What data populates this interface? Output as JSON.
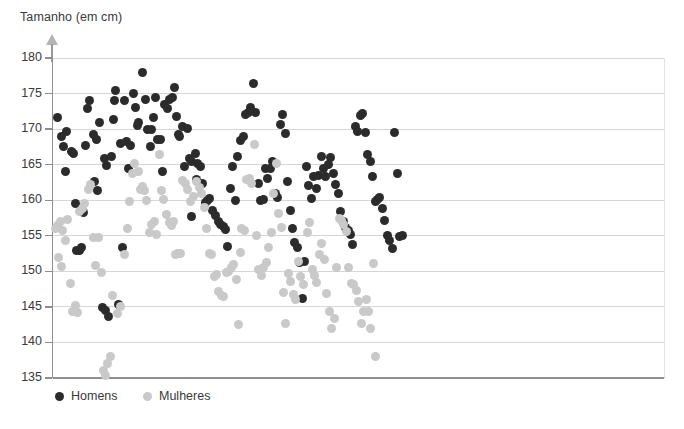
{
  "chart_data": {
    "type": "scatter",
    "title": "",
    "axis_label_y": "Tamanho (em cm)",
    "xlabel": "",
    "ylabel": "Tamanho (em cm)",
    "ylim": [
      135,
      180
    ],
    "yticks": [
      135,
      140,
      145,
      150,
      155,
      160,
      165,
      170,
      175,
      180
    ],
    "grid": true,
    "grid_axis": "y",
    "xaxis_visible": false,
    "xlim": [
      0,
      150
    ],
    "legend_position": "bottom-left",
    "colors": {
      "homens": "#2b2b2b",
      "mulheres": "#c9c9c9",
      "grid": "#d6d6d6",
      "axis": "#8e8e8e"
    },
    "series": [
      {
        "name": "Homens",
        "color": "#2b2b2b",
        "marker": "circle",
        "count": 150,
        "points": [
          [
            1.0,
            171.6
          ],
          [
            2.2,
            169.0
          ],
          [
            2.6,
            167.6
          ],
          [
            3.4,
            169.6
          ],
          [
            4.6,
            166.8
          ],
          [
            3.0,
            164.0
          ],
          [
            5.0,
            166.6
          ],
          [
            5.6,
            159.5
          ],
          [
            7.4,
            158.3
          ],
          [
            8.4,
            172.9
          ],
          [
            9.0,
            174.0
          ],
          [
            8.0,
            167.7
          ],
          [
            10.0,
            169.3
          ],
          [
            10.6,
            168.6
          ],
          [
            11.4,
            170.9
          ],
          [
            11.0,
            161.3
          ],
          [
            10.2,
            162.7
          ],
          [
            12.6,
            165.8
          ],
          [
            13.2,
            164.9
          ],
          [
            14.2,
            166.2
          ],
          [
            14.8,
            171.4
          ],
          [
            15.2,
            175.4
          ],
          [
            15.0,
            174.0
          ],
          [
            16.6,
            168.0
          ],
          [
            17.4,
            174.0
          ],
          [
            18.4,
            164.4
          ],
          [
            18.0,
            168.2
          ],
          [
            19.0,
            167.7
          ],
          [
            19.6,
            175.0
          ],
          [
            20.2,
            173.1
          ],
          [
            20.6,
            170.5
          ],
          [
            21.0,
            171.0
          ],
          [
            21.8,
            177.9
          ],
          [
            22.6,
            174.2
          ],
          [
            23.2,
            169.9
          ],
          [
            23.8,
            167.6
          ],
          [
            24.6,
            171.7
          ],
          [
            25.0,
            174.5
          ],
          [
            25.6,
            168.5
          ],
          [
            26.2,
            168.6
          ],
          [
            26.8,
            164.0
          ],
          [
            27.4,
            173.5
          ],
          [
            28.0,
            172.9
          ],
          [
            28.6,
            174.2
          ],
          [
            29.2,
            174.5
          ],
          [
            29.8,
            175.9
          ],
          [
            30.2,
            171.8
          ],
          [
            30.8,
            169.2
          ],
          [
            31.0,
            168.9
          ],
          [
            31.6,
            170.3
          ],
          [
            32.2,
            164.8
          ],
          [
            32.8,
            170.1
          ],
          [
            33.4,
            165.9
          ],
          [
            34.0,
            165.4
          ],
          [
            34.8,
            166.6
          ],
          [
            35.4,
            165.1
          ],
          [
            36.0,
            164.8
          ],
          [
            36.6,
            162.3
          ],
          [
            37.2,
            159.7
          ],
          [
            37.8,
            159.9
          ],
          [
            38.4,
            160.2
          ],
          [
            39.0,
            158.6
          ],
          [
            39.8,
            157.9
          ],
          [
            40.4,
            157.0
          ],
          [
            41.0,
            156.6
          ],
          [
            41.6,
            156.3
          ],
          [
            42.2,
            155.9
          ],
          [
            42.8,
            153.5
          ],
          [
            43.4,
            161.6
          ],
          [
            44.0,
            164.8
          ],
          [
            44.6,
            160.0
          ],
          [
            45.2,
            166.2
          ],
          [
            46.0,
            168.4
          ],
          [
            46.6,
            169.0
          ],
          [
            47.2,
            172.1
          ],
          [
            47.8,
            172.4
          ],
          [
            48.4,
            173.1
          ],
          [
            49.0,
            176.4
          ],
          [
            49.6,
            172.3
          ],
          [
            50.2,
            162.4
          ],
          [
            50.8,
            159.9
          ],
          [
            51.4,
            160.1
          ],
          [
            52.0,
            164.4
          ],
          [
            52.6,
            163.0
          ],
          [
            53.2,
            164.5
          ],
          [
            53.8,
            165.4
          ],
          [
            54.4,
            161.0
          ],
          [
            55.0,
            160.4
          ],
          [
            55.6,
            170.7
          ],
          [
            56.2,
            172.0
          ],
          [
            56.8,
            169.4
          ],
          [
            57.4,
            162.7
          ],
          [
            58.0,
            158.5
          ],
          [
            58.6,
            156.0
          ],
          [
            59.2,
            154.1
          ],
          [
            59.8,
            153.3
          ],
          [
            60.4,
            151.3
          ],
          [
            61.0,
            146.2
          ],
          [
            62.0,
            164.8
          ],
          [
            62.6,
            162.1
          ],
          [
            63.2,
            160.2
          ],
          [
            63.8,
            163.4
          ],
          [
            64.4,
            161.7
          ],
          [
            65.0,
            163.5
          ],
          [
            65.6,
            166.1
          ],
          [
            66.2,
            164.5
          ],
          [
            66.8,
            163.4
          ],
          [
            67.4,
            165.0
          ],
          [
            68.0,
            166.0
          ],
          [
            68.6,
            163.8
          ],
          [
            69.2,
            162.2
          ],
          [
            69.8,
            160.9
          ],
          [
            70.4,
            158.4
          ],
          [
            71.0,
            157.0
          ],
          [
            71.6,
            156.2
          ],
          [
            72.2,
            155.8
          ],
          [
            72.8,
            155.2
          ],
          [
            73.4,
            153.8
          ],
          [
            74.0,
            170.3
          ],
          [
            74.6,
            169.6
          ],
          [
            75.2,
            171.9
          ],
          [
            75.8,
            172.2
          ],
          [
            76.4,
            169.5
          ],
          [
            77.0,
            166.5
          ],
          [
            77.6,
            165.4
          ],
          [
            78.2,
            163.3
          ],
          [
            78.8,
            159.8
          ],
          [
            79.4,
            160.1
          ],
          [
            80.0,
            160.4
          ],
          [
            80.6,
            158.8
          ],
          [
            81.2,
            157.1
          ],
          [
            81.8,
            155.0
          ],
          [
            82.4,
            154.3
          ],
          [
            83.0,
            153.2
          ],
          [
            83.6,
            169.5
          ],
          [
            84.2,
            163.8
          ],
          [
            84.8,
            154.9
          ],
          [
            85.4,
            155.0
          ],
          [
            5.8,
            152.9
          ],
          [
            6.4,
            153.0
          ],
          [
            7.0,
            153.4
          ],
          [
            12.0,
            144.9
          ],
          [
            12.8,
            144.5
          ],
          [
            13.6,
            143.6
          ],
          [
            16.0,
            145.3
          ],
          [
            17.0,
            153.3
          ],
          [
            61.6,
            151.4
          ],
          [
            33.8,
            157.7
          ],
          [
            35.0,
            162.9
          ],
          [
            24.0,
            170.0
          ]
        ]
      },
      {
        "name": "Mulheres",
        "color": "#c9c9c9",
        "marker": "circle",
        "count": 130,
        "points": [
          [
            0.6,
            156.0
          ],
          [
            1.2,
            156.4
          ],
          [
            1.8,
            157.0
          ],
          [
            2.4,
            155.8
          ],
          [
            3.0,
            154.4
          ],
          [
            3.6,
            157.3
          ],
          [
            2.0,
            150.7
          ],
          [
            1.4,
            152.0
          ],
          [
            4.2,
            148.3
          ],
          [
            4.8,
            144.3
          ],
          [
            5.4,
            145.2
          ],
          [
            6.0,
            144.2
          ],
          [
            6.6,
            158.4
          ],
          [
            7.2,
            158.8
          ],
          [
            7.8,
            159.5
          ],
          [
            8.6,
            161.5
          ],
          [
            9.2,
            162.2
          ],
          [
            9.8,
            154.7
          ],
          [
            10.4,
            150.8
          ],
          [
            11.2,
            154.8
          ],
          [
            11.8,
            149.8
          ],
          [
            12.4,
            136.0
          ],
          [
            12.9,
            135.3
          ],
          [
            13.4,
            137.0
          ],
          [
            14.0,
            138.0
          ],
          [
            14.6,
            146.6
          ],
          [
            15.8,
            144.1
          ],
          [
            16.4,
            145.0
          ],
          [
            17.6,
            152.4
          ],
          [
            18.2,
            156.0
          ],
          [
            18.8,
            159.8
          ],
          [
            19.4,
            163.8
          ],
          [
            20.0,
            165.1
          ],
          [
            20.8,
            164.0
          ],
          [
            21.4,
            161.5
          ],
          [
            22.0,
            162.0
          ],
          [
            22.4,
            161.3
          ],
          [
            23.0,
            160.0
          ],
          [
            23.6,
            155.4
          ],
          [
            24.2,
            156.6
          ],
          [
            24.8,
            157.0
          ],
          [
            25.4,
            155.2
          ],
          [
            26.0,
            166.4
          ],
          [
            26.6,
            161.4
          ],
          [
            27.0,
            160.1
          ],
          [
            27.8,
            158.0
          ],
          [
            28.4,
            156.8
          ],
          [
            29.0,
            156.4
          ],
          [
            29.6,
            157.0
          ],
          [
            30.4,
            152.5
          ],
          [
            31.2,
            152.5
          ],
          [
            31.8,
            162.8
          ],
          [
            32.4,
            162.4
          ],
          [
            33.0,
            161.5
          ],
          [
            33.6,
            159.8
          ],
          [
            34.4,
            160.5
          ],
          [
            35.2,
            162.6
          ],
          [
            35.8,
            161.8
          ],
          [
            36.4,
            161.0
          ],
          [
            37.0,
            159.0
          ],
          [
            37.6,
            156.0
          ],
          [
            38.2,
            152.5
          ],
          [
            38.8,
            152.4
          ],
          [
            39.4,
            149.3
          ],
          [
            40.0,
            149.5
          ],
          [
            40.6,
            147.2
          ],
          [
            41.2,
            146.6
          ],
          [
            41.8,
            146.5
          ],
          [
            42.4,
            149.8
          ],
          [
            43.0,
            150.0
          ],
          [
            43.6,
            150.5
          ],
          [
            44.2,
            151.0
          ],
          [
            44.8,
            148.9
          ],
          [
            45.4,
            142.5
          ],
          [
            46.2,
            156.0
          ],
          [
            46.8,
            155.8
          ],
          [
            47.4,
            162.9
          ],
          [
            48.0,
            163.1
          ],
          [
            48.6,
            162.4
          ],
          [
            49.2,
            167.8
          ],
          [
            49.8,
            155.0
          ],
          [
            50.4,
            150.2
          ],
          [
            51.0,
            149.4
          ],
          [
            51.6,
            150.6
          ],
          [
            52.2,
            151.2
          ],
          [
            52.8,
            153.3
          ],
          [
            53.4,
            155.5
          ],
          [
            54.0,
            161.0
          ],
          [
            54.6,
            165.2
          ],
          [
            55.2,
            158.2
          ],
          [
            55.8,
            156.2
          ],
          [
            56.4,
            147.0
          ],
          [
            57.0,
            142.7
          ],
          [
            57.6,
            149.7
          ],
          [
            58.2,
            148.6
          ],
          [
            58.8,
            146.8
          ],
          [
            59.4,
            146.0
          ],
          [
            60.0,
            151.4
          ],
          [
            60.6,
            149.3
          ],
          [
            61.2,
            148.1
          ],
          [
            62.2,
            155.4
          ],
          [
            62.8,
            156.8
          ],
          [
            63.4,
            150.3
          ],
          [
            64.0,
            149.4
          ],
          [
            64.6,
            148.5
          ],
          [
            65.2,
            152.4
          ],
          [
            65.8,
            153.9
          ],
          [
            66.4,
            151.7
          ],
          [
            67.0,
            146.9
          ],
          [
            67.6,
            144.4
          ],
          [
            68.2,
            142.0
          ],
          [
            68.8,
            143.4
          ],
          [
            69.4,
            150.5
          ],
          [
            70.0,
            157.4
          ],
          [
            70.6,
            157.2
          ],
          [
            71.2,
            156.6
          ],
          [
            71.8,
            155.6
          ],
          [
            72.4,
            150.6
          ],
          [
            73.0,
            148.3
          ],
          [
            73.6,
            148.2
          ],
          [
            74.2,
            147.3
          ],
          [
            74.8,
            145.8
          ],
          [
            75.4,
            142.6
          ],
          [
            76.0,
            144.4
          ],
          [
            76.6,
            146.0
          ],
          [
            77.2,
            144.3
          ],
          [
            77.8,
            142.0
          ],
          [
            78.4,
            151.1
          ],
          [
            79.0,
            138.0
          ],
          [
            45.8,
            152.6
          ],
          [
            30.0,
            152.3
          ]
        ]
      }
    ]
  },
  "legend": {
    "items": [
      {
        "label": "Homens",
        "color": "#2b2b2b"
      },
      {
        "label": "Mulheres",
        "color": "#c9c9c9"
      }
    ]
  }
}
